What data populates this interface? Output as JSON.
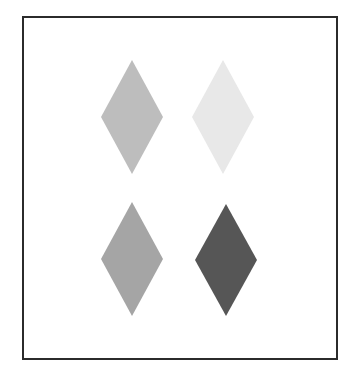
{
  "frame": {
    "x": 23,
    "y": 17,
    "width": 314,
    "height": 342,
    "stroke": "#2b2b2b",
    "stroke_width": 2,
    "fill": "#ffffff"
  },
  "diamonds": [
    {
      "name": "diamond-top-left",
      "cx": 132,
      "cy": 117,
      "half_width": 31,
      "half_height": 57,
      "fill": "#bdbdbd"
    },
    {
      "name": "diamond-top-right",
      "cx": 223,
      "cy": 117,
      "half_width": 31,
      "half_height": 57,
      "fill": "#e8e8e8"
    },
    {
      "name": "diamond-bottom-left",
      "cx": 132,
      "cy": 259,
      "half_width": 31,
      "half_height": 57,
      "fill": "#a5a5a5"
    },
    {
      "name": "diamond-bottom-right",
      "cx": 226,
      "cy": 260,
      "half_width": 31,
      "half_height": 56,
      "fill": "#565656"
    }
  ]
}
